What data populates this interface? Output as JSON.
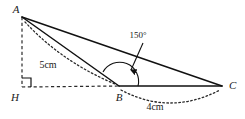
{
  "figure": {
    "type": "geometry-diagram",
    "background_color": "#ffffff",
    "ink_color": "#111111"
  },
  "vertices": [
    {
      "id": "A",
      "label": "A",
      "x": 22,
      "y": 17,
      "label_x": 16,
      "label_y": 13
    },
    {
      "id": "H",
      "label": "H",
      "x": 22,
      "y": 87,
      "label_x": 15,
      "label_y": 101
    },
    {
      "id": "B",
      "label": "B",
      "x": 119,
      "y": 86,
      "label_x": 116,
      "label_y": 101
    },
    {
      "id": "C",
      "label": "C",
      "x": 222,
      "y": 86,
      "label_x": 229,
      "label_y": 85
    }
  ],
  "edges": [
    {
      "name": "edge-AB",
      "from": "A",
      "to": "B",
      "style": "solid"
    },
    {
      "name": "edge-AC",
      "from": "A",
      "to": "C",
      "style": "solid"
    },
    {
      "name": "edge-BC",
      "from": "B",
      "to": "C",
      "style": "solid"
    },
    {
      "name": "edge-AH",
      "from": "A",
      "to": "H",
      "style": "dashed"
    },
    {
      "name": "edge-HB",
      "from": "H",
      "to": "B",
      "style": "dashed"
    }
  ],
  "measurements": [
    {
      "name": "measure-AB",
      "label": "5cm",
      "segment": "AB",
      "label_x": 48,
      "label_y": 68,
      "arc_path": "M 25 22 Q 62 62 115 84"
    },
    {
      "name": "measure-BC",
      "label": "4cm",
      "segment": "BC",
      "label_x": 155,
      "label_y": 110,
      "arc_path": "M 121 90 Q 170 116 220 90"
    }
  ],
  "angle_annotation": {
    "name": "angle-ABC",
    "label": "150°",
    "vertex": "B",
    "value_degrees": 150,
    "label_x": 138,
    "label_y": 38,
    "arc_radius": 19,
    "leader_start_x": 143,
    "leader_start_y": 43,
    "leader_end_x": 131,
    "leader_end_y": 72
  },
  "right_angle": {
    "name": "right-angle-at-H",
    "vertex": "H",
    "size": 9,
    "value_degrees": 90
  }
}
